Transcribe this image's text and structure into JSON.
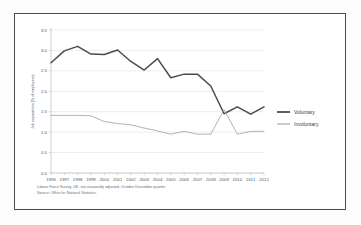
{
  "chart_data": {
    "type": "line",
    "title": "",
    "xlabel": "",
    "ylabel": "Job separations (% of employees)",
    "ylim": [
      0.0,
      3.5
    ],
    "ytick_labels": [
      "0.0",
      "0.5",
      "1.0",
      "1.5",
      "2.0",
      "2.5",
      "3.0",
      "3.5"
    ],
    "ytick_values": [
      0.0,
      0.5,
      1.0,
      1.5,
      2.0,
      2.5,
      3.0,
      3.5
    ],
    "grid": true,
    "legend_position": "right",
    "categories": [
      "1996",
      "1997",
      "1998",
      "1999",
      "2000",
      "2001",
      "2002",
      "2003",
      "2004",
      "2005",
      "2006",
      "2007",
      "2008",
      "2009",
      "2010",
      "2011",
      "2012"
    ],
    "series": [
      {
        "name": "Voluntary",
        "color": "#4b4b52",
        "width": 1.5,
        "values": [
          2.7,
          2.99,
          3.1,
          2.91,
          2.9,
          3.01,
          2.73,
          2.52,
          2.8,
          2.33,
          2.42,
          2.42,
          2.13,
          1.45,
          1.62,
          1.44,
          1.62
        ]
      },
      {
        "name": "Involuntary",
        "color": "#a8a8af",
        "width": 0.9,
        "values": [
          1.41,
          1.41,
          1.41,
          1.4,
          1.26,
          1.21,
          1.18,
          1.1,
          1.03,
          0.95,
          1.02,
          0.95,
          0.95,
          1.55,
          0.95,
          1.02,
          1.02
        ]
      }
    ]
  },
  "legend": {
    "items": [
      {
        "label": "Voluntary"
      },
      {
        "label": "Involuntary"
      }
    ]
  },
  "footnote": {
    "line1": "Labour Force Survey, UK, not seasonally adjusted, October-December quarter.",
    "line2": "Source: Office for National Statistics."
  }
}
